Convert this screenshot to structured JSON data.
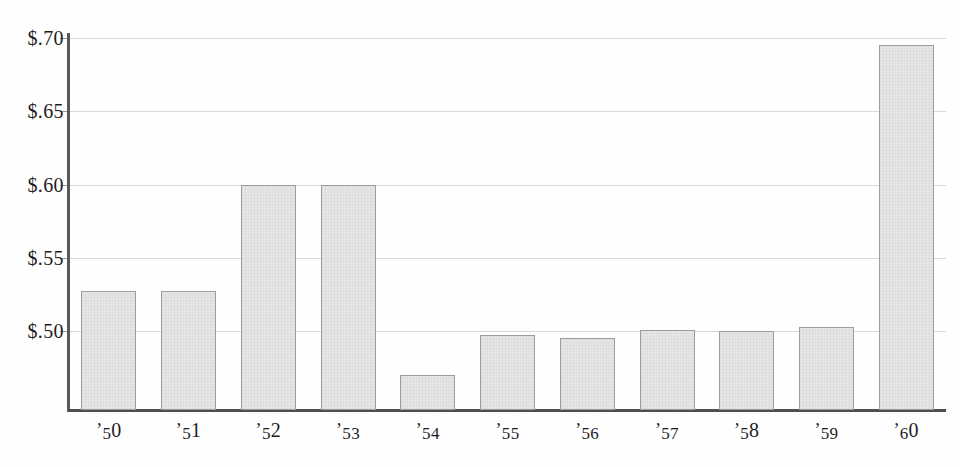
{
  "chart_data": {
    "type": "bar",
    "title": "",
    "subtitle": "",
    "xlabel": "",
    "ylabel": "",
    "categories": [
      "'50",
      "'51",
      "'52",
      "'53",
      "'54",
      "'55",
      "'56",
      "'57",
      "'58",
      "'59",
      "'60"
    ],
    "values": [
      0.527,
      0.527,
      0.6,
      0.6,
      0.47,
      0.497,
      0.495,
      0.501,
      0.5,
      0.503,
      0.695
    ],
    "ylim": [
      0.4545,
      0.7055
    ],
    "ytick_values": [
      0.7,
      0.65,
      0.6,
      0.55,
      0.5
    ],
    "ytick_labels": [
      "$.70",
      "$.65",
      "$.60",
      "$.55",
      "$.50"
    ],
    "grid": "horizontal",
    "legend": "none",
    "series": [
      {
        "name": "value",
        "values": [
          0.527,
          0.527,
          0.6,
          0.6,
          0.47,
          0.497,
          0.495,
          0.501,
          0.5,
          0.503,
          0.695
        ]
      }
    ],
    "annotations": []
  },
  "style": {
    "bar_fill": "#e6e6e6",
    "bar_border": "#9d9d9f",
    "gridline_color": "#d8d8d8",
    "axis_color": "#58585a",
    "text_color": "#1d1d1f",
    "background": "#fefefe"
  }
}
